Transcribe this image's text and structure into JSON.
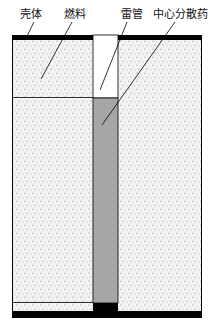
{
  "diagram": {
    "title": "",
    "labels": [
      {
        "id": "shell",
        "text": "壳体"
      },
      {
        "id": "fuel",
        "text": "燃料"
      },
      {
        "id": "detonator",
        "text": "雷管"
      },
      {
        "id": "central_charge",
        "text": "中心分散药"
      }
    ],
    "colors": {
      "shell": "#000000",
      "fuel": "#f2f2f2",
      "central_charge": "#a6a6a6",
      "detonator": "#ffffff"
    }
  }
}
